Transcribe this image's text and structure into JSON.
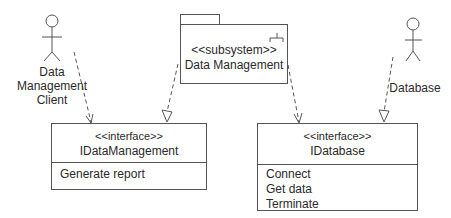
{
  "diagram": {
    "type": "UML component/dependency diagram",
    "actors": [
      {
        "id": "client",
        "label_lines": [
          "Data",
          "Management",
          "Client"
        ]
      },
      {
        "id": "database",
        "label_lines": [
          "Database"
        ]
      }
    ],
    "subsystem": {
      "stereotype": "<<subsystem>>",
      "name": "Data Management"
    },
    "interfaces": [
      {
        "id": "idatamanagement",
        "stereotype": "<<interface>>",
        "name": "IDataManagement",
        "operations": [
          "Generate report"
        ]
      },
      {
        "id": "idatabase",
        "stereotype": "<<interface>>",
        "name": "IDatabase",
        "operations": [
          "Connect",
          "Get data",
          "Terminate"
        ]
      }
    ],
    "dependencies": [
      {
        "from": "Data Management Client",
        "to": "IDataManagement",
        "style": "dashed",
        "head": "open"
      },
      {
        "from": "Data Management",
        "to": "IDataManagement",
        "style": "dashed",
        "head": "hollow-triangle"
      },
      {
        "from": "Data Management",
        "to": "IDatabase",
        "style": "dashed",
        "head": "open"
      },
      {
        "from": "Database",
        "to": "IDatabase",
        "style": "dashed",
        "head": "hollow-triangle"
      }
    ],
    "colors": {
      "line": "#555555",
      "text": "#2a2a2a",
      "background": "#ffffff"
    }
  }
}
